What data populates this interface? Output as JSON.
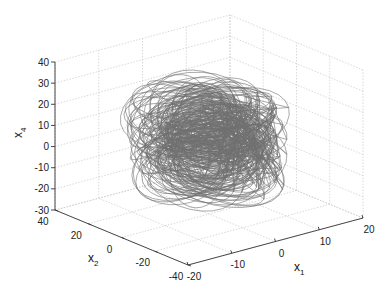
{
  "chart_data": {
    "type": "line3d",
    "title": "",
    "series": [
      {
        "name": "trajectory",
        "color": "#707070"
      }
    ],
    "axes": {
      "x": {
        "label": "x",
        "sub": "1",
        "range": [
          -20,
          20
        ],
        "ticks": [
          "-20",
          "-10",
          "0",
          "10",
          "20"
        ]
      },
      "y": {
        "label": "x",
        "sub": "2",
        "range": [
          -40,
          40
        ],
        "ticks": [
          "-40",
          "-20",
          "0",
          "20",
          "40"
        ]
      },
      "z": {
        "label": "x",
        "sub": "4",
        "range": [
          -30,
          40
        ],
        "ticks": [
          "-30",
          "-20",
          "-10",
          "0",
          "10",
          "20",
          "30",
          "40"
        ]
      }
    },
    "grid": true,
    "legend": null
  }
}
